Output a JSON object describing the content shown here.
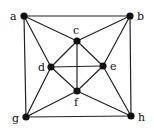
{
  "graph": {
    "nodes": [
      {
        "id": "a",
        "label": "a",
        "x": 24,
        "y": 16,
        "lx": 10,
        "ly": 20
      },
      {
        "id": "b",
        "label": "b",
        "x": 130,
        "y": 16,
        "lx": 137,
        "ly": 20
      },
      {
        "id": "c",
        "label": "c",
        "x": 77,
        "y": 41,
        "lx": 73,
        "ly": 34
      },
      {
        "id": "d",
        "label": "d",
        "x": 51,
        "y": 67,
        "lx": 38,
        "ly": 71
      },
      {
        "id": "e",
        "label": "e",
        "x": 103,
        "y": 66,
        "lx": 110,
        "ly": 70
      },
      {
        "id": "f",
        "label": "f",
        "x": 77,
        "y": 91,
        "lx": 74,
        "ly": 106
      },
      {
        "id": "g",
        "label": "g",
        "x": 26,
        "y": 117,
        "lx": 12,
        "ly": 122
      },
      {
        "id": "h",
        "label": "h",
        "x": 131,
        "y": 116,
        "lx": 138,
        "ly": 121
      }
    ],
    "edges": [
      [
        "a",
        "b"
      ],
      [
        "a",
        "g"
      ],
      [
        "b",
        "h"
      ],
      [
        "g",
        "h"
      ],
      [
        "a",
        "c"
      ],
      [
        "a",
        "d"
      ],
      [
        "b",
        "c"
      ],
      [
        "b",
        "e"
      ],
      [
        "g",
        "d"
      ],
      [
        "g",
        "f"
      ],
      [
        "h",
        "e"
      ],
      [
        "h",
        "f"
      ],
      [
        "c",
        "d"
      ],
      [
        "c",
        "e"
      ],
      [
        "d",
        "f"
      ],
      [
        "e",
        "f"
      ],
      [
        "c",
        "f"
      ],
      [
        "d",
        "e"
      ]
    ]
  }
}
